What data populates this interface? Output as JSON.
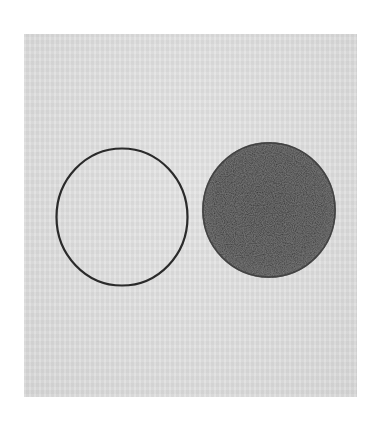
{
  "artwork": {
    "paper_color": "#ffffff",
    "plate_color": "#e2e2e2",
    "ink_color": "#2b2b2b",
    "plate": {
      "x": 24,
      "y": 34,
      "width": 333,
      "height": 363
    },
    "shapes": [
      {
        "type": "outline-circle",
        "cx": 122,
        "cy": 217,
        "rx": 66,
        "ry": 69,
        "stroke": "#2a2a2a",
        "stroke_width": 2.2
      },
      {
        "type": "filled-circle",
        "cx": 269,
        "cy": 210,
        "rx": 67,
        "ry": 68,
        "fill": "#333333"
      }
    ]
  }
}
